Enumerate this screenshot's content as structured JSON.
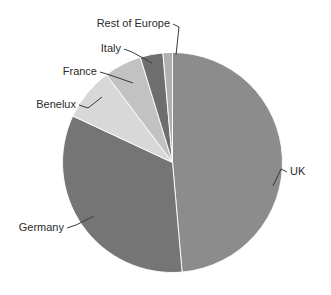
{
  "chart_data": {
    "type": "pie",
    "title": "",
    "subtitle": "",
    "xlabel": "",
    "ylabel": "",
    "legend_position": "none",
    "labels_position": "outside-with-leader-lines",
    "grid": false,
    "start_angle_deg": 0,
    "direction": "clockwise",
    "categories": [
      "UK",
      "Germany",
      "Benelux",
      "France",
      "Italy",
      "Rest of Europe"
    ],
    "values": [
      48.6,
      33.3,
      7.8,
      5.6,
      3.3,
      1.4
    ],
    "units": "percent",
    "slices": [
      {
        "label": "UK",
        "value": 48.6,
        "color": "#8c8c8c",
        "start_deg": 0.0,
        "end_deg": 175.0
      },
      {
        "label": "Germany",
        "value": 33.3,
        "color": "#757575",
        "start_deg": 175.0,
        "end_deg": 295.0
      },
      {
        "label": "Benelux",
        "value": 7.8,
        "color": "#d8d8d8",
        "start_deg": 295.0,
        "end_deg": 323.0
      },
      {
        "label": "France",
        "value": 5.6,
        "color": "#c2c2c2",
        "start_deg": 323.0,
        "end_deg": 343.0
      },
      {
        "label": "Italy",
        "value": 3.3,
        "color": "#6e6e6e",
        "start_deg": 343.0,
        "end_deg": 355.0
      },
      {
        "label": "Rest of Europe",
        "value": 1.4,
        "color": "#b0b0b0",
        "start_deg": 355.0,
        "end_deg": 360.0
      }
    ]
  },
  "labels": {
    "rest_of_europe": "Rest of Europe",
    "italy": "Italy",
    "france": "France",
    "benelux": "Benelux",
    "germany": "Germany",
    "uk": "UK"
  },
  "colors": {
    "background": "#ffffff",
    "text": "#2b2b2b",
    "leader": "#3a3a3a",
    "uk": "#8c8c8c",
    "germany": "#757575",
    "benelux": "#d8d8d8",
    "france": "#c2c2c2",
    "italy": "#6e6e6e",
    "rest_of_europe": "#b0b0b0"
  }
}
